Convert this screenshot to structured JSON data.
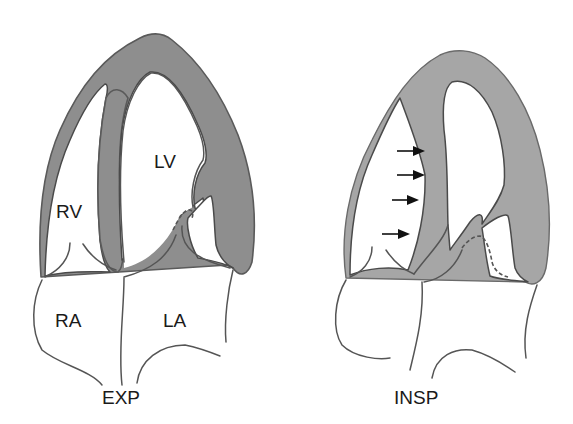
{
  "diagram": {
    "panels": [
      {
        "id": "expiration",
        "caption": "EXP",
        "chambers": {
          "rv": "RV",
          "lv": "LV",
          "ra": "RA",
          "la": "LA"
        }
      },
      {
        "id": "inspiration",
        "caption": "INSP",
        "arrows": 4,
        "arrow_direction": "right (septal shift toward LV)"
      }
    ],
    "colors": {
      "myocardium_exp": "#8e8e8e",
      "myocardium_insp": "#a6a6a6",
      "outline": "#555555",
      "background": "#ffffff"
    }
  }
}
